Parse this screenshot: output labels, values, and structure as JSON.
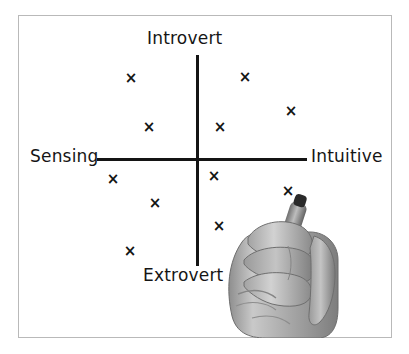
{
  "figure": {
    "title_visible": false,
    "background_color": "#ffffff",
    "frame_color": "#b9b9b9",
    "ink_color": "#141414"
  },
  "axes": {
    "vertical": {
      "top_label": "Introvert",
      "bottom_label": "Extrovert"
    },
    "horizontal": {
      "left_label": "Sensing",
      "right_label": "Intuitive"
    }
  },
  "illustration": {
    "hand_description": "hand holding marker",
    "marker_description": "marker-pen",
    "pen_tip_point": {
      "x": 288,
      "y": 196
    }
  },
  "chart_data": {
    "type": "scatter",
    "title": "",
    "xlabel": "Sensing — Intuitive",
    "ylabel": "Extrovert — Introvert",
    "marker": "x",
    "grid": false,
    "legend": "none",
    "axis_labels": {
      "x_left": "Sensing",
      "x_right": "Intuitive",
      "y_top": "Introvert",
      "y_bottom": "Extrovert"
    },
    "origin_px": {
      "x": 197,
      "y": 159
    },
    "xlim": [
      -1,
      1
    ],
    "ylim": [
      -1,
      1
    ],
    "points": [
      {
        "id": "p1",
        "quadrant": "Introvert-Sensing",
        "px": 131,
        "py": 78,
        "x": -0.6,
        "y": 0.77
      },
      {
        "id": "p2",
        "quadrant": "Introvert-Sensing",
        "px": 149,
        "py": 127,
        "x": -0.44,
        "y": 0.3
      },
      {
        "id": "p3",
        "quadrant": "Introvert-Intuitive",
        "px": 245,
        "py": 77,
        "x": 0.44,
        "y": 0.78
      },
      {
        "id": "p4",
        "quadrant": "Introvert-Intuitive",
        "px": 291,
        "py": 111,
        "x": 0.87,
        "y": 0.46
      },
      {
        "id": "p5",
        "quadrant": "Introvert-Intuitive",
        "px": 220,
        "py": 127,
        "x": 0.21,
        "y": 0.3
      },
      {
        "id": "p6",
        "quadrant": "Extrovert-Sensing",
        "px": 113,
        "py": 179,
        "x": -0.78,
        "y": -0.19
      },
      {
        "id": "p7",
        "quadrant": "Extrovert-Sensing",
        "px": 155,
        "py": 203,
        "x": -0.39,
        "y": -0.41
      },
      {
        "id": "p8",
        "quadrant": "Extrovert-Sensing",
        "px": 130,
        "py": 251,
        "x": -0.62,
        "y": -0.86
      },
      {
        "id": "p9",
        "quadrant": "Extrovert-Intuitive",
        "px": 214,
        "py": 176,
        "x": 0.16,
        "y": -0.16
      },
      {
        "id": "p10",
        "quadrant": "Extrovert-Intuitive",
        "px": 219,
        "py": 226,
        "x": 0.2,
        "y": -0.62
      },
      {
        "id": "p11",
        "quadrant": "Extrovert-Intuitive",
        "px": 288,
        "py": 191,
        "x": 0.84,
        "y": -0.3,
        "being_drawn": true
      }
    ],
    "point_count": 11,
    "quadrant_counts": {
      "Introvert-Sensing": 2,
      "Introvert-Intuitive": 3,
      "Extrovert-Sensing": 3,
      "Extrovert-Intuitive": 3
    },
    "marker_glyph": "×"
  }
}
